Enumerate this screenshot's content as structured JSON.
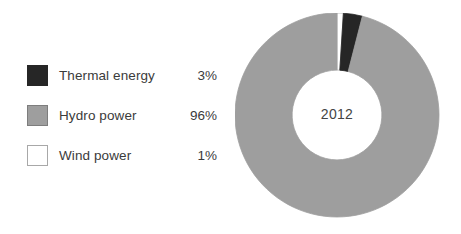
{
  "chart_data": {
    "type": "pie",
    "variant": "donut",
    "title": "",
    "center_label": "2012",
    "categories": [
      "Thermal energy",
      "Hydro power",
      "Wind power"
    ],
    "values": [
      3,
      96,
      1
    ],
    "value_labels": [
      "3%",
      "96%",
      "1%"
    ],
    "unit": "%",
    "colors": [
      "#262626",
      "#9e9e9e",
      "#ffffff"
    ],
    "slice_order_clockwise_from_top": [
      "Wind power",
      "Thermal energy",
      "Hydro power"
    ],
    "start_angle_deg": 0,
    "inner_radius_ratio": 0.44,
    "legend_position": "left",
    "grid": false,
    "xlabel": "",
    "ylabel": ""
  },
  "legend": {
    "items": [
      {
        "label": "Thermal energy",
        "value": "3%",
        "swatch_fill": "#262626",
        "swatch_border": "#262626",
        "icon": "legend-swatch-thermal"
      },
      {
        "label": "Hydro power",
        "value": "96%",
        "swatch_fill": "#9e9e9e",
        "swatch_border": "#7d7d7d",
        "icon": "legend-swatch-hydro"
      },
      {
        "label": "Wind power",
        "value": "1%",
        "swatch_fill": "#ffffff",
        "swatch_border": "#a8a8a8",
        "icon": "legend-swatch-wind"
      }
    ]
  },
  "donut": {
    "center_label": "2012",
    "slices": [
      {
        "name": "Wind power",
        "percent": 1,
        "fill": "#ffffff",
        "stroke": "#b4b4b4"
      },
      {
        "name": "Thermal energy",
        "percent": 3,
        "fill": "#262626",
        "stroke": "#262626"
      },
      {
        "name": "Hydro power",
        "percent": 96,
        "fill": "#9e9e9e",
        "stroke": "#9e9e9e"
      }
    ]
  },
  "theme": {
    "background": "#ffffff",
    "text_color": "#3b3b3b",
    "accent_dark": "#262626",
    "accent_gray": "#9e9e9e",
    "accent_light": "#ffffff"
  }
}
